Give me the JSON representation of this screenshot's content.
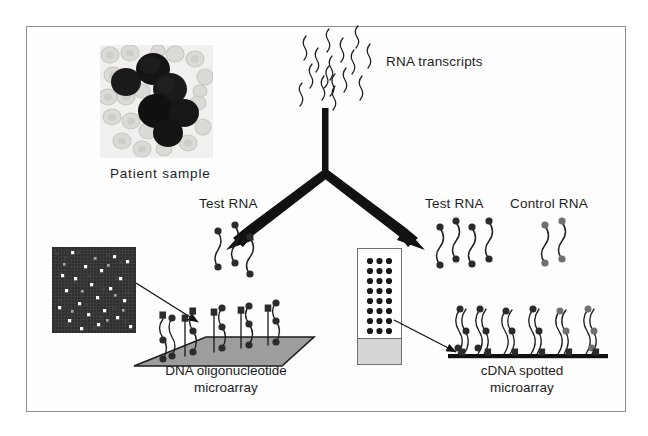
{
  "figure": {
    "domain": "diagram",
    "title_visible": false,
    "background_color": "#ffffff",
    "frame_color": "#8d8f93",
    "text_color": "#1d1d1d"
  },
  "labels": {
    "rna_transcripts": "RNA transcripts",
    "patient_sample": "Patient sample",
    "test_rna_left": "Test RNA",
    "test_rna_right": "Test RNA",
    "control_rna": "Control RNA"
  },
  "captions": {
    "oligo_line1": "DNA oligonucleotide",
    "oligo_line2": "microarray",
    "cdna_line1": "cDNA spotted",
    "cdna_line2": "microarray"
  },
  "panels": {
    "patient_sample": {
      "kind": "blood-smear-micrograph",
      "description": "Stained peripheral blood smear with clustered dark blast cells among pale erythrocytes",
      "background_color": "#f2f0ee",
      "cell_color": "#171717",
      "erythrocyte_color": "#d9d7d4",
      "dark_cells": [
        {
          "cx": 26,
          "cy": 37,
          "rx": 15,
          "ry": 14
        },
        {
          "cx": 53,
          "cy": 24,
          "rx": 17,
          "ry": 16
        },
        {
          "cx": 70,
          "cy": 44,
          "rx": 17,
          "ry": 16
        },
        {
          "cx": 56,
          "cy": 66,
          "rx": 18,
          "ry": 17
        },
        {
          "cx": 84,
          "cy": 68,
          "rx": 15,
          "ry": 14
        },
        {
          "cx": 68,
          "cy": 88,
          "rx": 15,
          "ry": 14
        }
      ]
    },
    "heatmap": {
      "kind": "microarray-scan",
      "description": "Dark gridded microarray scan image with scattered bright hybridization spots",
      "grid_cols": 26,
      "grid_rows": 26,
      "background_color": "#2b2b2b",
      "grid_line_color": "#4a4a4a",
      "bright_spot_color": "#f5f5f5"
    },
    "cdna_slide": {
      "kind": "glass-slide",
      "spot_color": "#1a1a1a",
      "spot_rows": 8,
      "spot_cols": 3,
      "frosted_end_color": "#d6d6d6",
      "border_color": "#6e7074"
    },
    "oligo_platform": {
      "kind": "3d-surface",
      "surface_color": "#9a9a9a",
      "edge_color": "#1d1d1d",
      "probe_count": 5
    },
    "cdna_platform": {
      "kind": "flat-substrate-line",
      "line_color": "#111111",
      "probe_count": 6
    }
  },
  "flow": {
    "stem_label": "RNA transcripts feed a Y-shaped split",
    "branch_left_target": "DNA oligonucleotide microarray",
    "branch_right_target": "cDNA spotted microarray",
    "arrow_color": "#111111"
  },
  "rna_strand_groups": {
    "test_rna_left": {
      "count": 3,
      "label_ref": "labels.test_rna_left"
    },
    "test_rna_right": {
      "count": 4,
      "label_ref": "labels.test_rna_right"
    },
    "control_rna": {
      "count": 2,
      "label_ref": "labels.control_rna"
    }
  }
}
